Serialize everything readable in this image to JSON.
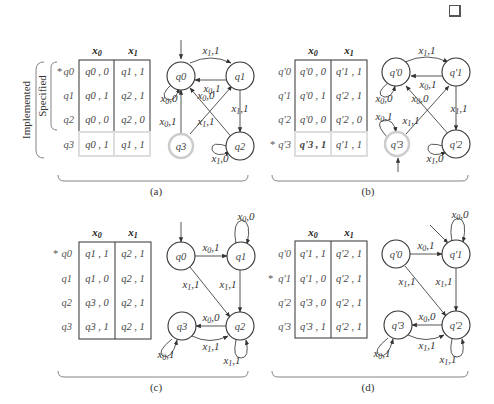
{
  "figure": {
    "end_mark": "qed-square",
    "side_labels": {
      "outer": "Implemented",
      "inner": "Specified"
    },
    "panels": [
      {
        "id": "a",
        "caption": "(a)",
        "columns": [
          "x0",
          "x1"
        ],
        "rows": [
          {
            "state": "q0",
            "initial_mark": "*",
            "x0": "q0 , 0",
            "x1": "q1 , 1",
            "implemented_only": false
          },
          {
            "state": "q1",
            "initial_mark": "",
            "x0": "q0 , 1",
            "x1": "q2 , 1",
            "implemented_only": false
          },
          {
            "state": "q2",
            "initial_mark": "",
            "x0": "q0 , 0",
            "x1": "q2 , 0",
            "implemented_only": false
          },
          {
            "state": "q3",
            "initial_mark": "",
            "x0": "q0 , 1",
            "x1": "q1 , 1",
            "implemented_only": true
          }
        ],
        "states": [
          "q0",
          "q1",
          "q2",
          "q3"
        ],
        "edges": [
          {
            "from": "q0",
            "to": "q1",
            "label": "x1,1"
          },
          {
            "from": "q1",
            "to": "q0",
            "label": "x0,1"
          },
          {
            "from": "q0",
            "to": "q0",
            "label": "x0,0"
          },
          {
            "from": "q2",
            "to": "q0",
            "label": "x0,0"
          },
          {
            "from": "q3",
            "to": "q0",
            "label": "x0,1"
          },
          {
            "from": "q3",
            "to": "q1",
            "label": "x1,1"
          },
          {
            "from": "q1",
            "to": "q2",
            "label": "x1,1"
          },
          {
            "from": "q2",
            "to": "q2",
            "label": "x1,0"
          }
        ]
      },
      {
        "id": "b",
        "caption": "(b)",
        "columns": [
          "x0",
          "x1"
        ],
        "rows": [
          {
            "state": "q'0",
            "initial_mark": "",
            "x0": "q'0 , 0",
            "x1": "q'1 , 1",
            "implemented_only": false
          },
          {
            "state": "q'1",
            "initial_mark": "",
            "x0": "q'0 , 1",
            "x1": "q'2 , 1",
            "implemented_only": false
          },
          {
            "state": "q'2",
            "initial_mark": "",
            "x0": "q'0 , 0",
            "x1": "q'2 , 0",
            "implemented_only": false
          },
          {
            "state": "q'3",
            "initial_mark": "*",
            "x0": "q'3 , 1",
            "x1": "q'1 , 1",
            "implemented_only": true
          }
        ],
        "states": [
          "q'0",
          "q'1",
          "q'2",
          "q'3"
        ],
        "edges": [
          {
            "from": "q'0",
            "to": "q'1",
            "label": "x1,1"
          },
          {
            "from": "q'1",
            "to": "q'0",
            "label": "x0,1"
          },
          {
            "from": "q'0",
            "to": "q'0",
            "label": "x0,0"
          },
          {
            "from": "q'2",
            "to": "q'0",
            "label": "x0,0"
          },
          {
            "from": "q'3",
            "to": "q'3",
            "label": "x0,1"
          },
          {
            "from": "q'3",
            "to": "q'1",
            "label": "x1,1"
          },
          {
            "from": "q'1",
            "to": "q'2",
            "label": "x1,1"
          },
          {
            "from": "q'2",
            "to": "q'2",
            "label": "x1,0"
          }
        ]
      },
      {
        "id": "c",
        "caption": "(c)",
        "columns": [
          "x0",
          "x1"
        ],
        "rows": [
          {
            "state": "q0",
            "initial_mark": "*",
            "x0": "q1 , 1",
            "x1": "q2 , 1"
          },
          {
            "state": "q1",
            "initial_mark": "",
            "x0": "q1 , 0",
            "x1": "q2 , 1"
          },
          {
            "state": "q2",
            "initial_mark": "",
            "x0": "q3 , 0",
            "x1": "q2 , 1"
          },
          {
            "state": "q3",
            "initial_mark": "",
            "x0": "q3 , 1",
            "x1": "q2 , 1"
          }
        ],
        "states": [
          "q0",
          "q1",
          "q2",
          "q3"
        ],
        "edges": [
          {
            "from": "q0",
            "to": "q1",
            "label": "x0,1"
          },
          {
            "from": "q1",
            "to": "q1",
            "label": "x0,0"
          },
          {
            "from": "q0",
            "to": "q2",
            "label": "x1,1"
          },
          {
            "from": "q1",
            "to": "q2",
            "label": "x1,1"
          },
          {
            "from": "q2",
            "to": "q3",
            "label": "x0,0"
          },
          {
            "from": "q3",
            "to": "q2",
            "label": "x1,1"
          },
          {
            "from": "q3",
            "to": "q3",
            "label": "x0,1"
          },
          {
            "from": "q2",
            "to": "q2",
            "label": "x1,1"
          }
        ]
      },
      {
        "id": "d",
        "caption": "(d)",
        "columns": [
          "x0",
          "x1"
        ],
        "rows": [
          {
            "state": "q'0",
            "initial_mark": "",
            "x0": "q'1 , 1",
            "x1": "q'2 , 1"
          },
          {
            "state": "q'1",
            "initial_mark": "*",
            "x0": "q'1 , 0",
            "x1": "q'2 , 1"
          },
          {
            "state": "q'2",
            "initial_mark": "",
            "x0": "q'3 , 0",
            "x1": "q'2 , 1"
          },
          {
            "state": "q'3",
            "initial_mark": "",
            "x0": "q'3 , 1",
            "x1": "q'2 , 1"
          }
        ],
        "states": [
          "q'0",
          "q'1",
          "q'2",
          "q'3"
        ],
        "edges": [
          {
            "from": "q'0",
            "to": "q'1",
            "label": "x0,1"
          },
          {
            "from": "q'1",
            "to": "q'1",
            "label": "x0,0"
          },
          {
            "from": "q'0",
            "to": "q'2",
            "label": "x1,1"
          },
          {
            "from": "q'1",
            "to": "q'2",
            "label": "x1,1"
          },
          {
            "from": "q'2",
            "to": "q'3",
            "label": "x0,0"
          },
          {
            "from": "q'3",
            "to": "q'2",
            "label": "x1,1"
          },
          {
            "from": "q'3",
            "to": "q'3",
            "label": "x0,1"
          },
          {
            "from": "q'2",
            "to": "q'2",
            "label": "x1,1"
          }
        ]
      }
    ]
  }
}
